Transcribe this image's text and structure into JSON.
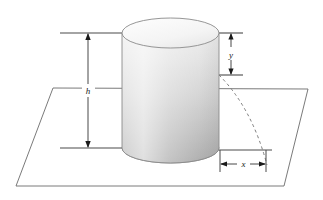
{
  "figure": {
    "kind": "3d-geometry-diagram",
    "background_color": "#ffffff",
    "line_color": "#555555",
    "dim_line_color": "#4a4a4a",
    "arrow_color": "#1a1a1a",
    "dashed_color": "#6e6e6e",
    "cylinder": {
      "name": "cylinder",
      "outline_color": "#8a8a8a",
      "top_face_fill_light": "#fbfbfb",
      "top_face_fill_dark": "#eaeaea",
      "body_fill_top": "#e9e9e9",
      "body_fill_bottom": "#a9a9a9",
      "bottom_face_fill": "#b4b4b4",
      "left_px": 122,
      "right_px": 219,
      "top_center_y_px": 33,
      "bottom_center_y_px": 148,
      "ellipse_ry_px": 15
    },
    "plane": {
      "name": "ground-plane",
      "stroke_color": "#6b6b6b",
      "fill": "none",
      "corners_px": [
        [
          53,
          88
        ],
        [
          308,
          89
        ],
        [
          284,
          186
        ],
        [
          16,
          186
        ]
      ]
    },
    "dimensions": [
      {
        "id": "h",
        "label": "h",
        "orientation": "vertical",
        "arrow_x_px": 88,
        "from_y_px": 33,
        "to_y_px": 148,
        "extension_lines": [
          {
            "y_px": 33,
            "x1_px": 60,
            "x2_px": 126
          },
          {
            "y_px": 148,
            "x1_px": 60,
            "x2_px": 127
          }
        ]
      },
      {
        "id": "y",
        "label": "y",
        "orientation": "vertical",
        "arrow_x_px": 231,
        "from_y_px": 33,
        "to_y_px": 75,
        "extension_lines": [
          {
            "y_px": 33,
            "x1_px": 216,
            "x2_px": 242
          },
          {
            "y_px": 75,
            "x1_px": 216,
            "x2_px": 242
          }
        ]
      },
      {
        "id": "x",
        "label": "x",
        "orientation": "horizontal",
        "arrow_y_px": 164,
        "from_x_px": 220,
        "to_x_px": 266,
        "extension_lines": [
          {
            "x_px": 220,
            "y1_px": 150,
            "y2_px": 172
          },
          {
            "x_px": 266,
            "y1_px": 150,
            "y2_px": 172
          }
        ]
      }
    ],
    "dashed_arc": {
      "name": "dashed-arc",
      "start_px": [
        219,
        75
      ],
      "end_px": [
        267,
        165
      ],
      "control_px": [
        250,
        110
      ],
      "dash_pattern": "3 3"
    }
  }
}
